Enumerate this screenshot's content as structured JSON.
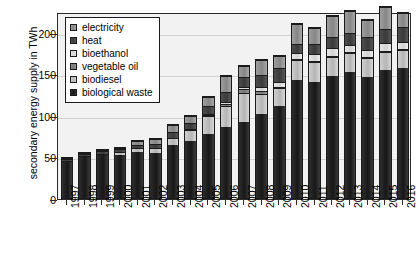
{
  "chart_data": {
    "type": "bar",
    "title": "",
    "subtitle": "",
    "xlabel": "",
    "ylabel": "secondary energy supply in TWh",
    "ylim": [
      0,
      225
    ],
    "yticks": [
      0,
      50,
      100,
      150,
      200
    ],
    "grid": true,
    "stacked": true,
    "legend_position": "top-left inside plot area",
    "categories": [
      "1997",
      "1998",
      "1999",
      "2000",
      "2001",
      "2002",
      "2003",
      "2004",
      "2005",
      "2006",
      "2007",
      "2008",
      "2009",
      "2010",
      "2011",
      "2012",
      "2013",
      "2014",
      "2015",
      "2016"
    ],
    "series": [
      {
        "name": "biological waste",
        "color": "#222222",
        "values": [
          46,
          52,
          55,
          54,
          57,
          56,
          66,
          71,
          79,
          87,
          93,
          103,
          112,
          144,
          142,
          148,
          153,
          147,
          156,
          158
        ]
      },
      {
        "name": "biodiesel",
        "color": "#c4c4c4",
        "values": [
          1,
          1,
          1,
          4,
          5,
          6,
          8,
          13,
          22,
          25,
          35,
          24,
          22,
          24,
          24,
          24,
          23,
          23,
          22,
          22
        ]
      },
      {
        "name": "vegetable oil",
        "color": "#7e7e7e",
        "values": [
          0,
          0,
          0,
          0,
          0,
          0,
          0,
          1,
          1,
          3,
          5,
          4,
          2,
          1,
          1,
          1,
          1,
          1,
          1,
          1
        ]
      },
      {
        "name": "bioethanol",
        "color": "#dcdcdc",
        "values": [
          0,
          0,
          0,
          0,
          0,
          0,
          0,
          0,
          1,
          2,
          3,
          4,
          6,
          7,
          8,
          9,
          9,
          9,
          9,
          9
        ]
      },
      {
        "name": "heat",
        "color": "#404040",
        "values": [
          3,
          3,
          3,
          3,
          4,
          5,
          7,
          8,
          10,
          13,
          12,
          15,
          17,
          12,
          13,
          14,
          15,
          16,
          17,
          18
        ]
      },
      {
        "name": "electricity",
        "color": "#919191",
        "values": [
          1,
          1,
          1,
          2,
          5,
          6,
          9,
          8,
          11,
          19,
          13,
          18,
          14,
          24,
          19,
          26,
          27,
          21,
          27,
          17
        ]
      }
    ],
    "totals": [
      51,
      57,
      60,
      63,
      71,
      73,
      90,
      101,
      124,
      149,
      161,
      168,
      173,
      212,
      207,
      222,
      228,
      217,
      232,
      225
    ]
  },
  "legend": {
    "items": [
      {
        "label": "electricity",
        "swatch": "legend-swatch-electricity"
      },
      {
        "label": "heat",
        "swatch": "legend-swatch-heat"
      },
      {
        "label": "bioethanol",
        "swatch": "legend-swatch-bioethanol"
      },
      {
        "label": "vegetable oil",
        "swatch": "legend-swatch-vegetable-oil"
      },
      {
        "label": "biodiesel",
        "swatch": "legend-swatch-biodiesel"
      },
      {
        "label": "biological waste",
        "swatch": "legend-swatch-biological-waste"
      }
    ]
  }
}
